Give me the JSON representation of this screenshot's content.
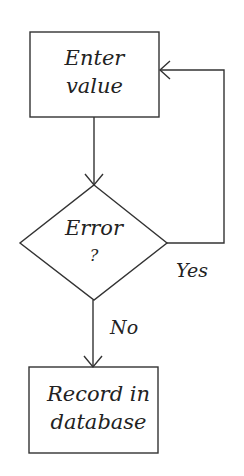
{
  "diagram": {
    "type": "flowchart",
    "stroke_color": "#333333",
    "background": "#ffffff",
    "nodes": [
      {
        "id": "enter",
        "shape": "rectangle",
        "line1": "Enter",
        "line2": "value"
      },
      {
        "id": "error",
        "shape": "diamond",
        "line1": "Error",
        "line2": "?"
      },
      {
        "id": "record",
        "shape": "rectangle",
        "line1": "Record in",
        "line2": "database"
      }
    ],
    "edges": [
      {
        "from": "enter",
        "to": "error",
        "label": ""
      },
      {
        "from": "error",
        "to": "enter",
        "label": "Yes"
      },
      {
        "from": "error",
        "to": "record",
        "label": "No"
      }
    ]
  }
}
